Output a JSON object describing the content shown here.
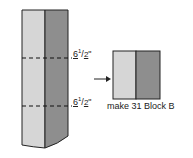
{
  "diagram": {
    "strip": {
      "left_color": "#d6d6d6",
      "right_color": "#8e8e8e",
      "outline_color": "#222222",
      "cut_lines": [
        {
          "label_whole": "6",
          "label_num": "1",
          "label_den": "2",
          "unit": "\""
        },
        {
          "label_whole": "6",
          "label_num": "1",
          "label_den": "2",
          "unit": "\""
        }
      ]
    },
    "arrow": "right-arrow",
    "block": {
      "left_color": "#d6d6d6",
      "right_color": "#8e8e8e",
      "caption": "make 31 Block B"
    }
  }
}
